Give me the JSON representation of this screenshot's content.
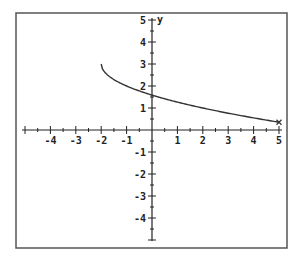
{
  "chart_data": {
    "type": "line",
    "title": "",
    "xlabel": "",
    "ylabel": "y",
    "xlim": [
      -5,
      5
    ],
    "ylim": [
      -5,
      5
    ],
    "x_ticks": [
      -4,
      -3,
      -2,
      -1,
      1,
      2,
      3,
      4,
      5
    ],
    "y_ticks": [
      -4,
      -3,
      -2,
      -1,
      1,
      2,
      3,
      4,
      5
    ],
    "x_tick_labels": [
      "-4",
      "-3",
      "-2",
      "-1",
      "1",
      "2",
      "3",
      "4",
      "5"
    ],
    "y_tick_labels": [
      "-4",
      "-3",
      "-2",
      "-1",
      "1",
      "2",
      "3",
      "4",
      "5"
    ],
    "minor_tick_step": 0.5,
    "grid": false,
    "legend": null,
    "series": [
      {
        "name": "f(x)",
        "equation_estimate": "y = 3 - sqrt(x + 2)",
        "x": [
          -2,
          -1.5,
          -1,
          -0.5,
          0,
          0.5,
          1,
          1.5,
          2,
          2.5,
          3,
          3.5,
          4,
          4.5,
          5
        ],
        "y": [
          3.0,
          2.29,
          2.0,
          1.78,
          1.59,
          1.42,
          1.27,
          1.13,
          1.0,
          0.88,
          0.76,
          0.65,
          0.55,
          0.45,
          0.35
        ],
        "endpoint_marker": {
          "x": 5,
          "y": 0.35,
          "symbol": "x"
        }
      }
    ],
    "axis_label_y": "y"
  },
  "colors": {
    "frame": "#555555",
    "axis": "#222222",
    "curve": "#333333",
    "background": "#ffffff"
  }
}
